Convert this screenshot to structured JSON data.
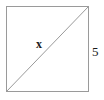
{
  "figure": {
    "type": "geometry-diagram",
    "shape": "square",
    "background_color": "#ffffff",
    "stroke_color": "#9a9a9a",
    "stroke_width": 1,
    "text_color": "#1a1a1a",
    "square": {
      "name": "square-outline",
      "left": 6,
      "top": 6,
      "right": 89,
      "bottom": 92,
      "width": 83,
      "height": 86
    },
    "diagonal": {
      "name": "diagonal-line",
      "x1": 6,
      "y1": 92,
      "x2": 89,
      "y2": 6
    },
    "labels": [
      {
        "id": "diagonal-label",
        "text": "x",
        "meaning": "length of the diagonal (unknown)",
        "x": 42,
        "y": 44,
        "style": "bold-italic-serif"
      },
      {
        "id": "side-label",
        "text": "5",
        "meaning": "length of the right side of the square",
        "x": 96,
        "y": 52,
        "style": "serif"
      }
    ]
  }
}
